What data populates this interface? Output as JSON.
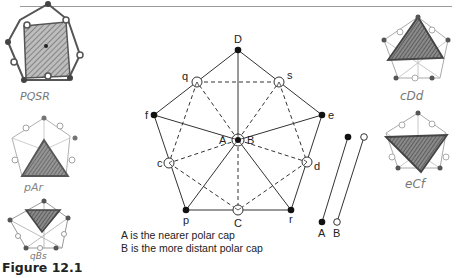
{
  "header": {
    "partial_text": "DOUBLE POLARS"
  },
  "figure": {
    "caption": "Figure 12.1"
  },
  "main_diagram": {
    "vertices": [
      {
        "id": "D",
        "label": "D",
        "type": "filled"
      },
      {
        "id": "q",
        "label": "q",
        "type": "open"
      },
      {
        "id": "s",
        "label": "s",
        "type": "open"
      },
      {
        "id": "f",
        "label": "f",
        "type": "filled"
      },
      {
        "id": "e",
        "label": "e",
        "type": "filled"
      },
      {
        "id": "c",
        "label": "c",
        "type": "open"
      },
      {
        "id": "d",
        "label": "d",
        "type": "open"
      },
      {
        "id": "p",
        "label": "p",
        "type": "filled"
      },
      {
        "id": "C",
        "label": "C",
        "type": "open"
      },
      {
        "id": "r",
        "label": "r",
        "type": "filled"
      },
      {
        "id": "A",
        "label": "A",
        "type": "filled-center"
      },
      {
        "id": "B",
        "label": "B",
        "type": "open-center"
      }
    ],
    "side_poles": {
      "A_label": "A",
      "B_label": "B"
    }
  },
  "legend": {
    "items": [
      "A is the nearer polar cap",
      "B is the more distant polar cap"
    ]
  },
  "sketches": [
    {
      "label": "PQSR",
      "position": "top-left"
    },
    {
      "label": "pAr",
      "position": "middle-left"
    },
    {
      "label": "qBs",
      "position": "bottom-left"
    },
    {
      "label": "cDd",
      "position": "top-right"
    },
    {
      "label": "eCf",
      "position": "middle-right"
    }
  ]
}
